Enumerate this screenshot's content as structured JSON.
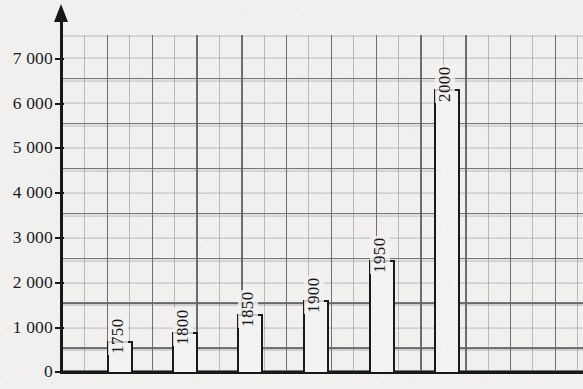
{
  "chart_data": {
    "type": "bar",
    "title": "",
    "subtitle": "",
    "xlabel": "",
    "ylabel": "",
    "categories": [
      "1750",
      "1800",
      "1850",
      "1900",
      "1950",
      "2000"
    ],
    "values": [
      700,
      900,
      1300,
      1600,
      2500,
      6300
    ],
    "ylim": [
      0,
      7500
    ],
    "y_ticks": [
      0,
      1000,
      2000,
      3000,
      4000,
      5000,
      6000,
      7000
    ],
    "y_tick_labels": [
      "0",
      "1 000",
      "2 000",
      "3 000",
      "4 000",
      "5 000",
      "6 000",
      "7 000"
    ],
    "grid": true,
    "grid_minor_step": 500,
    "legend": null,
    "legend_position": "none",
    "bar_labels_rotated": true,
    "colors": {
      "bar_fill": "#f3f2f0",
      "bar_outline": "#1a1a1c",
      "axis": "#17181a",
      "grid_major": "#55555c",
      "grid_minor": "#787880",
      "background": "#f1f0ee",
      "text": "#1b1b1d"
    }
  },
  "axis": {
    "y_tick_labels": [
      "7 000",
      "6 000",
      "5 000",
      "4 000",
      "3 000",
      "2 000",
      "1 000",
      "0"
    ]
  },
  "bars": [
    {
      "label": "1750",
      "value": 700
    },
    {
      "label": "1800",
      "value": 900
    },
    {
      "label": "1850",
      "value": 1300
    },
    {
      "label": "1900",
      "value": 1600
    },
    {
      "label": "1950",
      "value": 2500
    },
    {
      "label": "2000",
      "value": 6300
    }
  ]
}
